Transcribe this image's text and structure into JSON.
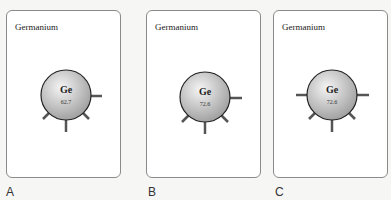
{
  "panels": [
    {
      "label": "A",
      "title": "Germanium",
      "symbol": "Ge",
      "value": "62.7",
      "bonds": [
        "right",
        "lower-left",
        "bottom",
        "lower-right"
      ]
    },
    {
      "label": "B",
      "title": "Germanium",
      "symbol": "Ge",
      "value": "72.6",
      "bonds": [
        "right",
        "lower-left",
        "bottom",
        "lower-right"
      ]
    },
    {
      "label": "C",
      "title": "Germanium",
      "symbol": "Ge",
      "value": "72.6",
      "bonds": [
        "left",
        "right",
        "lower-left",
        "bottom",
        "lower-right"
      ]
    }
  ],
  "colors": {
    "bond": "#555555",
    "atom_outline": "#222222",
    "atom_fill_light": "#f2f2f2",
    "atom_fill_dark": "#9a9a9a"
  }
}
